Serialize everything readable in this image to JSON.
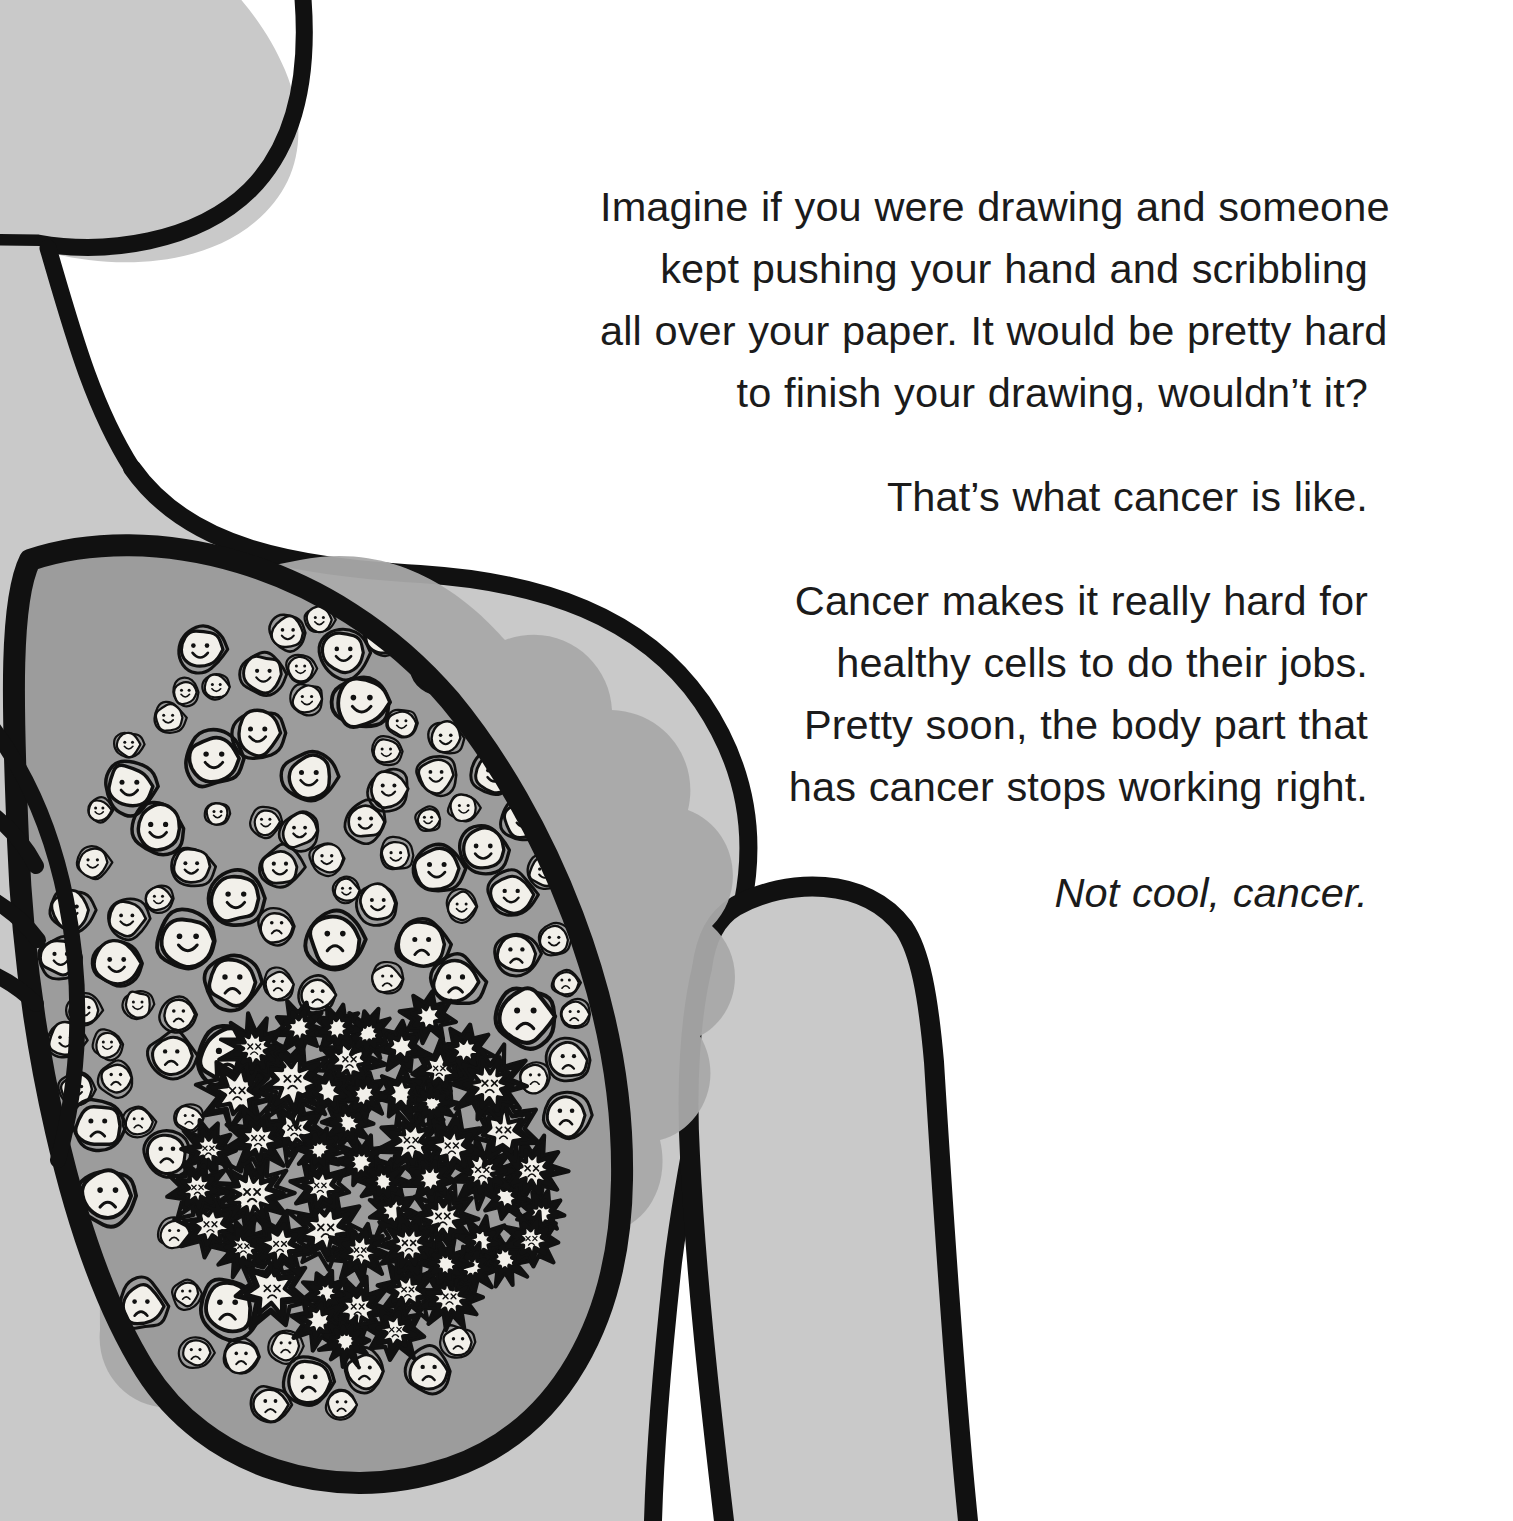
{
  "page": {
    "kind": "picture-book-page",
    "background_color": "#ffffff",
    "body_fill_color": "#c9c9c9",
    "shadow_color": "#a9a9a9",
    "lung_fill_color": "#9c9c9c",
    "cell_fill_color": "#f2f0ea",
    "ink_color": "#111111",
    "text_color": "#1b1b1b"
  },
  "text_block": {
    "alignment": "right",
    "paragraphs": [
      {
        "id": "paragraph-imagine",
        "style": "regular",
        "lines": [
          "Imagine if you were drawing and someone",
          "kept pushing your hand and scribbling",
          "all over your paper. It would be pretty hard",
          "to finish your drawing, wouldn’t it?"
        ]
      },
      {
        "id": "paragraph-thats-what",
        "style": "regular",
        "lines": [
          "That’s what cancer is like."
        ]
      },
      {
        "id": "paragraph-cancer-makes",
        "style": "regular",
        "lines": [
          "Cancer makes it really hard for",
          "healthy cells to do their jobs.",
          "Pretty soon, the body part that",
          "has cancer stops working right."
        ]
      },
      {
        "id": "paragraph-not-cool",
        "style": "italic",
        "lines": [
          "Not cool, cancer."
        ]
      }
    ]
  },
  "illustration": {
    "name": "torso-with-diseased-lung",
    "parts": [
      {
        "id": "head",
        "label": "head"
      },
      {
        "id": "neck",
        "label": "neck"
      },
      {
        "id": "torso",
        "label": "torso"
      },
      {
        "id": "arm",
        "label": "arm"
      },
      {
        "id": "lung",
        "label": "lung"
      },
      {
        "id": "lung-shadow",
        "label": "lung shadow"
      },
      {
        "id": "ribs",
        "label": "ribs"
      }
    ],
    "cells": {
      "happy_label": "healthy cell",
      "sad_label": "struggling cell",
      "tumor_label": "cancer cell cluster"
    }
  }
}
